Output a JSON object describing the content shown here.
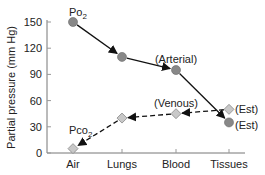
{
  "chart_data": {
    "type": "line",
    "title": "",
    "xlabel": "",
    "ylabel": "Partial pressure (mm Hg)",
    "categories": [
      "Air",
      "Lungs",
      "Blood",
      "Tissues"
    ],
    "ylim": [
      0,
      150
    ],
    "yticks": [
      0,
      30,
      60,
      90,
      120,
      150
    ],
    "grid": false,
    "series": [
      {
        "name": "PO2",
        "label_main": "Po",
        "label_sub": "2",
        "values": [
          150,
          110,
          95,
          35
        ],
        "marker": "circle",
        "line": "solid",
        "direction": "Air→Tissues",
        "color": "#888888"
      },
      {
        "name": "PCO2",
        "label_main": "Pco",
        "label_sub": "2",
        "values": [
          5,
          40,
          45,
          50
        ],
        "marker": "diamond",
        "line": "dashed",
        "direction": "Tissues→Air",
        "color": "#aaaaaa"
      }
    ],
    "annotations": [
      {
        "text": "(Arterial)",
        "series": "PO2",
        "category": "Blood"
      },
      {
        "text": "(Venous)",
        "series": "PCO2",
        "category": "Blood"
      },
      {
        "text": "(Est)",
        "series": "PCO2",
        "category": "Tissues"
      },
      {
        "text": "(Est)",
        "series": "PO2",
        "category": "Tissues"
      }
    ]
  }
}
